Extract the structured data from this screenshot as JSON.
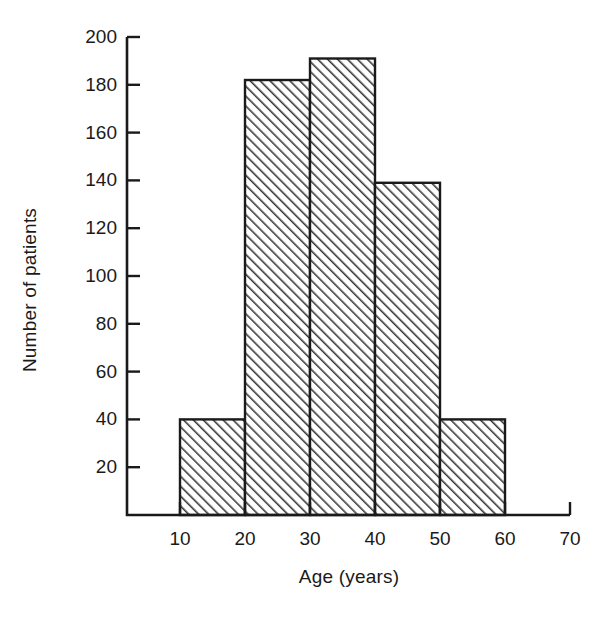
{
  "chart_data": {
    "type": "bar",
    "title": "",
    "subtitle": "",
    "xlabel": "Age (years)",
    "ylabel": "Number of patients",
    "categories": [
      "10-20",
      "20-30",
      "30-40",
      "40-50",
      "50-60"
    ],
    "bin_edges": [
      10,
      20,
      30,
      40,
      50,
      60
    ],
    "values": [
      40,
      182,
      191,
      139,
      40
    ],
    "xlim": [
      5,
      70
    ],
    "ylim": [
      0,
      200
    ],
    "xticks": [
      10,
      20,
      30,
      40,
      50,
      60,
      70
    ],
    "xtick_labels": [
      "10",
      "20",
      "30",
      "40",
      "50",
      "60",
      "70"
    ],
    "yticks": [
      20,
      40,
      60,
      80,
      100,
      120,
      140,
      160,
      180,
      200
    ],
    "ytick_labels": [
      "20",
      "40",
      "60",
      "80",
      "100",
      "120",
      "140",
      "160",
      "180",
      "200"
    ],
    "grid": false,
    "legend": null,
    "bar_fill": "diagonal-hatch",
    "bar_edge_color": "#1a1a1a",
    "axis_color": "#1a1a1a",
    "background_color": "#ffffff"
  }
}
